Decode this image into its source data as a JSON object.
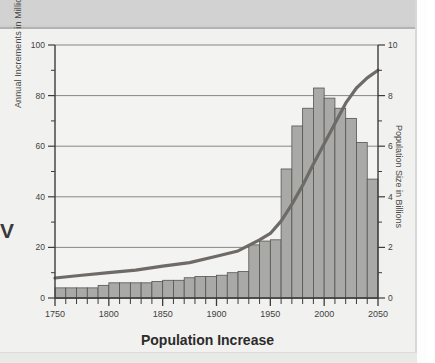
{
  "page": {
    "background_color": "#f1f1ef",
    "band_color": "#d2d2d2",
    "caption_fragment": "V"
  },
  "chart_data": {
    "type": "bar",
    "title": "",
    "xlabel": "Population Increase",
    "ylabel": "Annual Increments in Millions",
    "y2label": "Population Size in Billions",
    "xlim": [
      1750,
      2050
    ],
    "ylim": [
      0,
      100
    ],
    "y2lim": [
      0,
      10
    ],
    "grid": true,
    "legend_position": "none",
    "x_major_ticks": [
      1750,
      1800,
      1850,
      1900,
      1950,
      2000,
      2050
    ],
    "x_tick_labels": [
      "1750",
      "1800",
      "1850",
      "1900",
      "1950",
      "2000",
      "2050"
    ],
    "x_minor_tick_interval": 10,
    "y_major_ticks": [
      0,
      20,
      40,
      60,
      80,
      100
    ],
    "y_tick_labels": [
      "0",
      "20",
      "40",
      "60",
      "80",
      "100"
    ],
    "y_minor_ticks": [
      10,
      30,
      50,
      70,
      90
    ],
    "y2_major_ticks": [
      0,
      2,
      4,
      6,
      8,
      10
    ],
    "y2_tick_labels": [
      "0",
      "2",
      "4",
      "6",
      "8",
      "10"
    ],
    "y2_minor_ticks": [
      1,
      3,
      5,
      7,
      9
    ],
    "bar_color": "#a9a9a7",
    "bar_edge_color": "#55554f",
    "line_color": "#6e6a66",
    "bar_width_years": 10,
    "series": [
      {
        "name": "Annual Increments in Millions",
        "type": "bar",
        "axis": "left",
        "categories": [
          1750,
          1760,
          1770,
          1780,
          1790,
          1800,
          1810,
          1820,
          1830,
          1840,
          1850,
          1860,
          1870,
          1880,
          1890,
          1900,
          1910,
          1920,
          1930,
          1940,
          1950,
          1960,
          1970,
          1980,
          1990,
          2000,
          2010,
          2020,
          2030,
          2040
        ],
        "values": [
          4,
          4,
          4,
          4,
          5,
          6,
          6,
          6,
          6,
          6.5,
          7,
          7,
          8,
          8.5,
          8.5,
          9,
          10,
          10.5,
          21,
          22.5,
          23,
          51,
          68,
          75,
          83,
          79,
          75,
          71,
          61.5,
          47,
          33
        ]
      },
      {
        "name": "Population Size in Billions",
        "type": "line",
        "axis": "right",
        "x": [
          1750,
          1775,
          1800,
          1825,
          1850,
          1875,
          1900,
          1920,
          1940,
          1950,
          1960,
          1970,
          1980,
          1990,
          2000,
          2010,
          2020,
          2030,
          2040,
          2050
        ],
        "values": [
          0.79,
          0.9,
          1.0,
          1.1,
          1.26,
          1.4,
          1.65,
          1.86,
          2.3,
          2.55,
          3.04,
          3.7,
          4.45,
          5.3,
          6.1,
          6.9,
          7.7,
          8.3,
          8.7,
          9.0
        ]
      }
    ]
  }
}
